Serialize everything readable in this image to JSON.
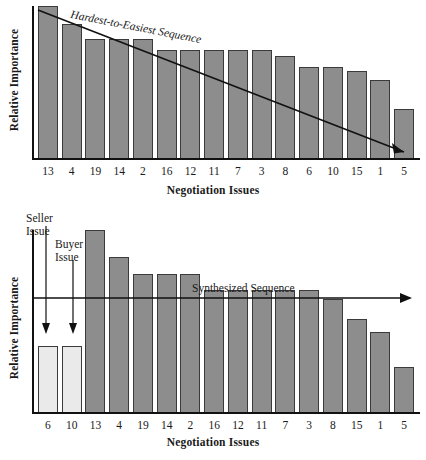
{
  "figure": {
    "panels": [
      {
        "id": "top",
        "ylabel": "Relative Importance",
        "xlabel": "Negotiation Issues",
        "annotation": "Hardest-to-Easiest Sequence"
      },
      {
        "id": "bottom",
        "ylabel": "Relative Importance",
        "xlabel": "Negotiation Issues",
        "annotation": "Synthesized Sequence",
        "callout_seller_line1": "Seller",
        "callout_seller_line2": "Issue",
        "callout_buyer_line1": "Buyer",
        "callout_buyer_line2": "Issue"
      }
    ],
    "colors": {
      "bar_dark": "#8d8d8d",
      "bar_light": "#eaeaea",
      "bar_border": "#3a3a3a",
      "axis": "#111111",
      "text": "#1a1a1a"
    }
  },
  "chart_data": [
    {
      "type": "bar",
      "title": "",
      "annotation": "Hardest-to-Easiest Sequence",
      "xlabel": "Negotiation Issues",
      "ylabel": "Relative Importance",
      "grid": false,
      "legend": "none",
      "ylim": [
        0,
        100
      ],
      "categories": [
        "13",
        "4",
        "19",
        "14",
        "2",
        "16",
        "12",
        "11",
        "7",
        "3",
        "8",
        "6",
        "10",
        "15",
        "1",
        "5"
      ],
      "values": [
        100,
        88,
        78,
        78,
        78,
        71,
        71,
        71,
        71,
        71,
        67,
        60,
        60,
        57,
        51,
        32
      ],
      "bar_styles": [
        "dark",
        "dark",
        "dark",
        "dark",
        "dark",
        "dark",
        "dark",
        "dark",
        "dark",
        "dark",
        "dark",
        "dark",
        "dark",
        "dark",
        "dark",
        "dark"
      ]
    },
    {
      "type": "bar",
      "title": "",
      "annotation": "Synthesized Sequence",
      "xlabel": "Negotiation Issues",
      "ylabel": "Relative Importance",
      "grid": false,
      "legend": "none",
      "ylim": [
        0,
        100
      ],
      "categories": [
        "6",
        "10",
        "13",
        "4",
        "19",
        "14",
        "2",
        "16",
        "12",
        "11",
        "7",
        "3",
        "8",
        "15",
        "1",
        "5"
      ],
      "values": [
        36,
        36,
        100,
        85,
        76,
        76,
        76,
        67,
        67,
        67,
        67,
        67,
        62,
        51,
        44,
        25
      ],
      "bar_styles": [
        "light",
        "light",
        "dark",
        "dark",
        "dark",
        "dark",
        "dark",
        "dark",
        "dark",
        "dark",
        "dark",
        "dark",
        "dark",
        "dark",
        "dark",
        "dark"
      ],
      "annotations": [
        {
          "label": "Seller Issue",
          "target_category": "6"
        },
        {
          "label": "Buyer Issue",
          "target_category": "10"
        }
      ]
    }
  ]
}
